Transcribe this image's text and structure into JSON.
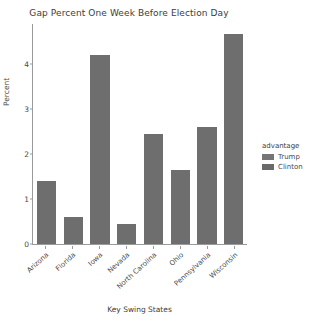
{
  "chart_data": {
    "type": "bar",
    "title": "Gap Percent One Week Before Election Day",
    "xlabel": "Key Swing States",
    "ylabel": "Percent",
    "categories": [
      "Arizona",
      "Florida",
      "Iowa",
      "Nevada",
      "North Carolina",
      "Ohio",
      "Pennsylvania",
      "Wisconsin"
    ],
    "values": [
      1.4,
      0.6,
      4.2,
      0.45,
      2.45,
      1.65,
      2.6,
      4.65
    ],
    "bar_advantage": [
      "Trump",
      "Trump",
      "Trump",
      "Trump",
      "Trump",
      "Trump",
      "Trump",
      "Trump"
    ],
    "ylim": [
      0,
      4.9
    ],
    "yticks": [
      0,
      1,
      2,
      3,
      4
    ],
    "ytick_labels": [
      "0",
      "1",
      "2",
      "3",
      "4"
    ],
    "grid": false,
    "legend": {
      "title": "advantage",
      "position": "right",
      "entries": [
        {
          "label": "Trump",
          "color": "#757575"
        },
        {
          "label": "Clinton",
          "color": "#6a6a6a"
        }
      ]
    },
    "bar_color": "#6e6e6e",
    "background_color": "#ffffff",
    "axis_color": "#9a9a9a",
    "text_color": "#3c3c3c"
  }
}
